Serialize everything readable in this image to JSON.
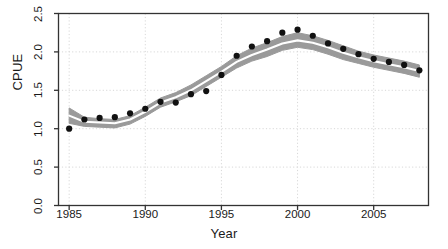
{
  "chart_data": {
    "type": "scatter",
    "title": "",
    "subtitle": "",
    "xlabel": "Year",
    "ylabel": "CPUE",
    "xlim": [
      1984.3,
      2008.6
    ],
    "ylim": [
      0,
      2.5
    ],
    "xticks": [
      1985,
      1990,
      1995,
      2000,
      2005
    ],
    "xtick_labels": [
      "1985",
      "1990",
      "1995",
      "2000",
      "2005"
    ],
    "yticks": [
      0.0,
      0.5,
      1.0,
      1.5,
      2.0,
      2.5
    ],
    "ytick_labels": [
      "0.0",
      "0.5",
      "1.0",
      "1.5",
      "2.0",
      "2.5"
    ],
    "grid": true,
    "grid_style": "dotted",
    "legend": "none",
    "x": [
      1985,
      1986,
      1987,
      1988,
      1989,
      1990,
      1991,
      1992,
      1993,
      1994,
      1995,
      1996,
      1997,
      1998,
      1999,
      2000,
      2001,
      2002,
      2003,
      2004,
      2005,
      2006,
      2007,
      2008
    ],
    "series": [
      {
        "name": "Observed CPUE",
        "marker": "filled-circle",
        "color": "#111111",
        "values": [
          1.0,
          1.12,
          1.14,
          1.15,
          1.2,
          1.26,
          1.35,
          1.34,
          1.45,
          1.49,
          1.7,
          1.95,
          2.07,
          2.14,
          2.25,
          2.29,
          2.21,
          2.11,
          2.04,
          1.97,
          1.91,
          1.87,
          1.83,
          1.76
        ]
      },
      {
        "name": "Fitted index (band centre)",
        "marker": "line",
        "color": "#ffffff",
        "values": [
          1.17,
          1.09,
          1.08,
          1.07,
          1.12,
          1.22,
          1.34,
          1.41,
          1.5,
          1.62,
          1.74,
          1.87,
          1.96,
          2.03,
          2.11,
          2.15,
          2.12,
          2.06,
          1.99,
          1.93,
          1.88,
          1.84,
          1.8,
          1.75
        ]
      },
      {
        "name": "Confidence band upper",
        "marker": "band",
        "color": "#999999",
        "values": [
          1.27,
          1.15,
          1.13,
          1.12,
          1.17,
          1.28,
          1.4,
          1.47,
          1.57,
          1.69,
          1.81,
          1.95,
          2.05,
          2.12,
          2.2,
          2.25,
          2.21,
          2.15,
          2.08,
          2.01,
          1.96,
          1.92,
          1.88,
          1.83
        ]
      },
      {
        "name": "Confidence band lower",
        "marker": "band",
        "color": "#999999",
        "values": [
          1.07,
          1.03,
          1.02,
          1.01,
          1.06,
          1.16,
          1.28,
          1.35,
          1.43,
          1.55,
          1.67,
          1.79,
          1.88,
          1.94,
          2.02,
          2.06,
          2.03,
          1.97,
          1.9,
          1.85,
          1.8,
          1.76,
          1.72,
          1.67
        ]
      }
    ],
    "colors": {
      "marker": "#111111",
      "band": "#9a9a9a",
      "band_centre_line": "#ffffff",
      "axis": "#333333",
      "grid": "#d8d8d8",
      "background": "#ffffff",
      "text": "#1a1a1a"
    }
  },
  "axes": {
    "x_title": "Year",
    "y_title": "CPUE"
  }
}
